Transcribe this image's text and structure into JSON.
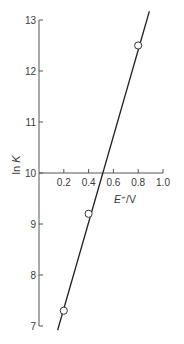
{
  "chart_data": {
    "type": "scatter",
    "title": "",
    "xlabel": "E⦵/V",
    "xlabel_parts": {
      "italic": "E",
      "superscript": "⦵",
      "rest": "/V"
    },
    "ylabel": "ln K",
    "ylabel_parts": {
      "plain": "ln ",
      "italic": "K"
    },
    "xlim": [
      0,
      1.0
    ],
    "ylim": [
      7,
      13
    ],
    "x_ticks": [
      0.2,
      0.4,
      0.6,
      0.8,
      1.0
    ],
    "x_tick_labels": [
      "0.2",
      "0.4",
      "0.6",
      "0.8",
      "1.0"
    ],
    "y_ticks": [
      7,
      8,
      9,
      10,
      11,
      12,
      13
    ],
    "y_tick_labels": [
      "7",
      "8",
      "9",
      "10",
      "11",
      "12",
      "13"
    ],
    "x_axis_crosses_y_at": 10,
    "grid": false,
    "legend": null,
    "series": [
      {
        "name": "data",
        "marker": "open-circle",
        "x": [
          0.2,
          0.4,
          0.8
        ],
        "y": [
          7.3,
          9.2,
          12.5
        ]
      }
    ],
    "fit_line": {
      "type": "linear",
      "slope": 8.45,
      "intercept": 5.65,
      "x_range": [
        0.15,
        0.89
      ]
    },
    "colors": {
      "axis": "#555555",
      "line": "#222222",
      "marker_fill": "#ffffff",
      "marker_edge": "#333333",
      "text": "#3a3a3a"
    }
  }
}
